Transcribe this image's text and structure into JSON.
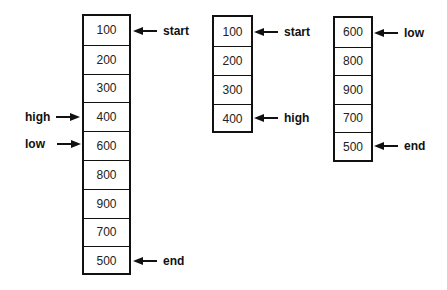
{
  "diagram": {
    "arrays": [
      {
        "name": "full-array",
        "cells": [
          "100",
          "200",
          "300",
          "400",
          "600",
          "800",
          "900",
          "700",
          "500"
        ],
        "pointers": [
          {
            "label": "start",
            "index": 0,
            "side": "right"
          },
          {
            "label": "high",
            "index": 3,
            "side": "left"
          },
          {
            "label": "low",
            "index": 4,
            "side": "left"
          },
          {
            "label": "end",
            "index": 8,
            "side": "right"
          }
        ]
      },
      {
        "name": "left-subarray",
        "cells": [
          "100",
          "200",
          "300",
          "400"
        ],
        "pointers": [
          {
            "label": "start",
            "index": 0,
            "side": "right"
          },
          {
            "label": "high",
            "index": 3,
            "side": "right"
          }
        ]
      },
      {
        "name": "right-subarray",
        "cells": [
          "600",
          "800",
          "900",
          "700",
          "500"
        ],
        "pointers": [
          {
            "label": "low",
            "index": 0,
            "side": "right"
          },
          {
            "label": "end",
            "index": 4,
            "side": "right"
          }
        ]
      }
    ]
  }
}
